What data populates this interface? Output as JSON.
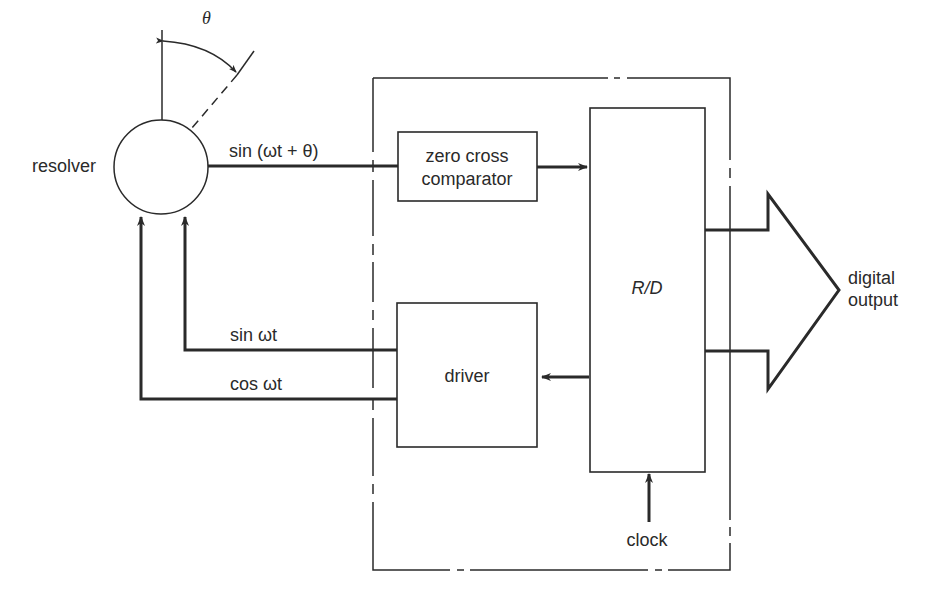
{
  "diagram": {
    "resolver": {
      "label": "resolver",
      "angle_symbol": "θ"
    },
    "signals": {
      "feedback_signal": "sin (ωt + θ)",
      "excitation_sin": "sin ωt",
      "excitation_cos": "cos ωt"
    },
    "blocks": {
      "comparator_line1": "zero cross",
      "comparator_line2": "comparator",
      "driver": "driver",
      "converter": "R/D"
    },
    "inputs": {
      "clock": "clock"
    },
    "output": {
      "line1": "digital",
      "line2": "output"
    },
    "colors": {
      "line": "#2a2a2a",
      "background": "#ffffff"
    }
  }
}
